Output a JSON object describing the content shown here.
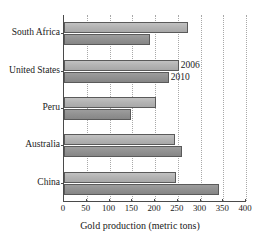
{
  "chart_data": {
    "type": "bar",
    "orientation": "horizontal",
    "title": "World Gold Production",
    "xlabel": "Gold production (metric tons)",
    "ylabel": "",
    "xlim": [
      0,
      400
    ],
    "xticks": [
      0,
      50,
      100,
      150,
      200,
      250,
      300,
      350,
      400
    ],
    "xtick_labels": [
      "0",
      "50",
      "100",
      "150",
      "200",
      "250",
      "300",
      "350",
      "400"
    ],
    "grid": true,
    "grid_axis": "x",
    "legend_position": "in-plot-annotation",
    "categories": [
      "South Africa",
      "United States",
      "Peru",
      "Australia",
      "China"
    ],
    "series": [
      {
        "name": "2006",
        "color": "#b4b4b4",
        "values": [
          272,
          252,
          203,
          245,
          247
        ]
      },
      {
        "name": "2010",
        "color": "#929292",
        "values": [
          190,
          230,
          148,
          260,
          340
        ]
      }
    ],
    "annotations": [
      {
        "text": "2006",
        "series": "2006",
        "category": "United States"
      },
      {
        "text": "2010",
        "series": "2010",
        "category": "United States"
      }
    ]
  }
}
